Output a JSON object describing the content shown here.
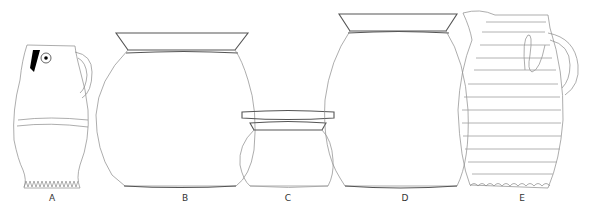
{
  "figure": {
    "type": "archaeological pottery line drawings",
    "vessels": [
      {
        "id": "A",
        "label": "A",
        "form": "jug with spout and handle, frilled base",
        "label_x": 52
      },
      {
        "id": "B",
        "label": "B",
        "form": "wide-mouthed jar",
        "label_x": 185
      },
      {
        "id": "C",
        "label": "C",
        "form": "small squat jar",
        "label_x": 288
      },
      {
        "id": "D",
        "label": "D",
        "form": "wide-mouthed jar",
        "label_x": 405
      },
      {
        "id": "E",
        "label": "E",
        "form": "ribbed jug with handle and applied decoration, frilled base",
        "label_x": 522
      }
    ]
  },
  "colors": {
    "background": "#ffffff",
    "line": "#8a8a8a",
    "rim": "#555555",
    "fill_mark": "#000000"
  }
}
